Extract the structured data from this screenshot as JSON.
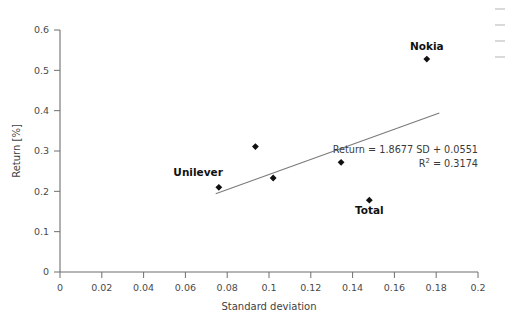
{
  "chart_data": {
    "type": "scatter",
    "title": "",
    "xlabel": "Standard deviation",
    "ylabel": "Return [%]",
    "xlim": [
      0,
      0.2
    ],
    "ylim": [
      0,
      0.6
    ],
    "xticks": [
      "0",
      "0.02",
      "0.04",
      "0.06",
      "0.08",
      "0.1",
      "0.12",
      "0.14",
      "0.16",
      "0.18",
      "0.2"
    ],
    "xtick_values": [
      0,
      0.02,
      0.04,
      0.06,
      0.08,
      0.1,
      0.12,
      0.14,
      0.16,
      0.18,
      0.2
    ],
    "yticks": [
      "0",
      "0.1",
      "0.2",
      "0.3",
      "0.4",
      "0.5",
      "0.6"
    ],
    "ytick_values": [
      0,
      0.1,
      0.2,
      0.3,
      0.4,
      0.5,
      0.6
    ],
    "grid": false,
    "legend": false,
    "marker": "diamond",
    "marker_color": "#101010",
    "trendline_color": "#7a7a7a",
    "points": [
      {
        "x": 0.076,
        "y": 0.21,
        "label": "Unilever",
        "label_position": "above-left"
      },
      {
        "x": 0.0935,
        "y": 0.311,
        "label": "",
        "label_position": ""
      },
      {
        "x": 0.102,
        "y": 0.233,
        "label": "",
        "label_position": ""
      },
      {
        "x": 0.1345,
        "y": 0.272,
        "label": "",
        "label_position": ""
      },
      {
        "x": 0.148,
        "y": 0.178,
        "label": "Total",
        "label_position": "below"
      },
      {
        "x": 0.1755,
        "y": 0.528,
        "label": "Nokia",
        "label_position": "above"
      }
    ],
    "trendline": {
      "slope": 1.8677,
      "intercept": 0.0551,
      "r_squared": 0.3174,
      "x_start": 0.0745,
      "x_end": 0.1815,
      "equation_text": "Return = 1.8677 SD + 0.0551",
      "r2_prefix": "R",
      "r2_exponent": "2",
      "r2_value": " = 0.3174"
    }
  },
  "labels": {
    "x_axis_title": "Standard deviation",
    "y_axis_title": "Return [%]"
  }
}
